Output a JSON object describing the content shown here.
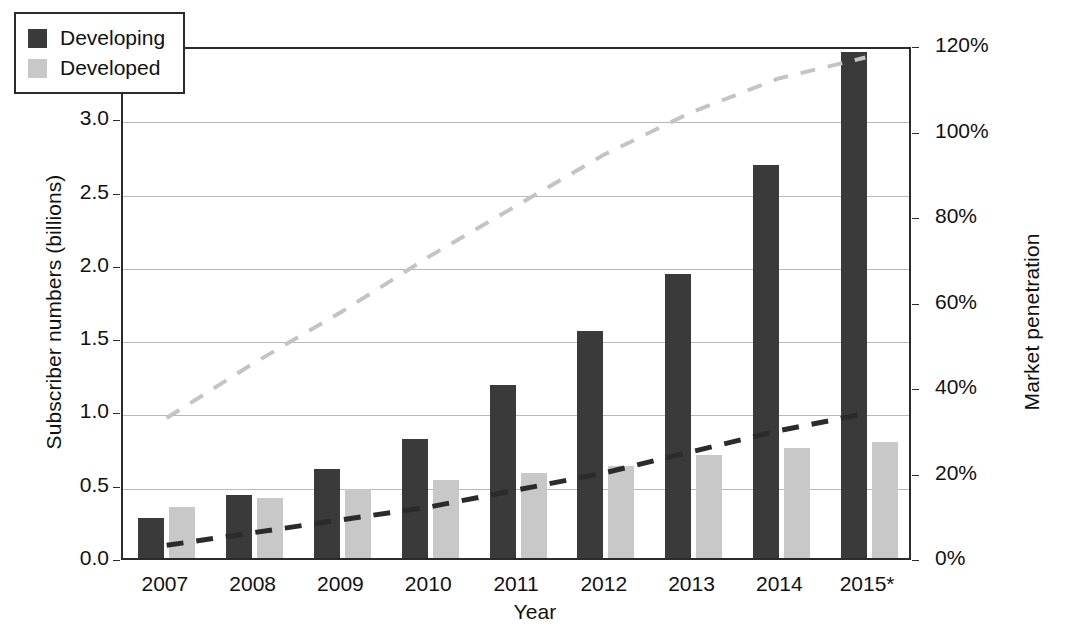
{
  "chart_data": {
    "type": "bar",
    "title": "",
    "subtitle": "",
    "xlabel": "Year",
    "ylabel": "Subscriber numbers (billions)",
    "y2label": "Market penetration",
    "categories": [
      "2007",
      "2008",
      "2009",
      "2010",
      "2011",
      "2012",
      "2013",
      "2014",
      "2015*"
    ],
    "series": [
      {
        "name": "Developing",
        "color": "#3a3a3a",
        "style": "bar",
        "values": [
          0.27,
          0.43,
          0.61,
          0.81,
          1.18,
          1.55,
          1.94,
          2.68,
          3.45
        ]
      },
      {
        "name": "Developed",
        "color": "#c8c8c8",
        "style": "bar",
        "values": [
          0.35,
          0.41,
          0.47,
          0.53,
          0.58,
          0.63,
          0.7,
          0.75,
          0.79
        ]
      },
      {
        "name": "Developed market penetration",
        "color": "#c4c4c4",
        "style": "dashed-line",
        "axis": "right",
        "values": [
          33,
          46,
          58,
          71,
          83,
          95,
          105,
          113,
          118
        ]
      },
      {
        "name": "Developing market penetration",
        "color": "#2b2b2b",
        "style": "dashed-line",
        "axis": "right",
        "values": [
          3,
          6,
          9,
          12,
          16,
          20,
          25,
          30,
          34
        ]
      }
    ],
    "ylim": [
      0.0,
      3.5
    ],
    "yticks": [
      "0.0",
      "0.5",
      "1.0",
      "1.5",
      "2.0",
      "2.5",
      "3.0",
      "3.5"
    ],
    "y2lim": [
      0,
      120
    ],
    "y2ticks": [
      "0%",
      "20%",
      "40%",
      "60%",
      "80%",
      "100%",
      "120%"
    ],
    "grid": "horizontal",
    "legend_position": "top-left",
    "legend_entries": [
      {
        "label": "Developing",
        "color": "#3a3a3a"
      },
      {
        "label": "Developed",
        "color": "#c8c8c8"
      }
    ]
  }
}
